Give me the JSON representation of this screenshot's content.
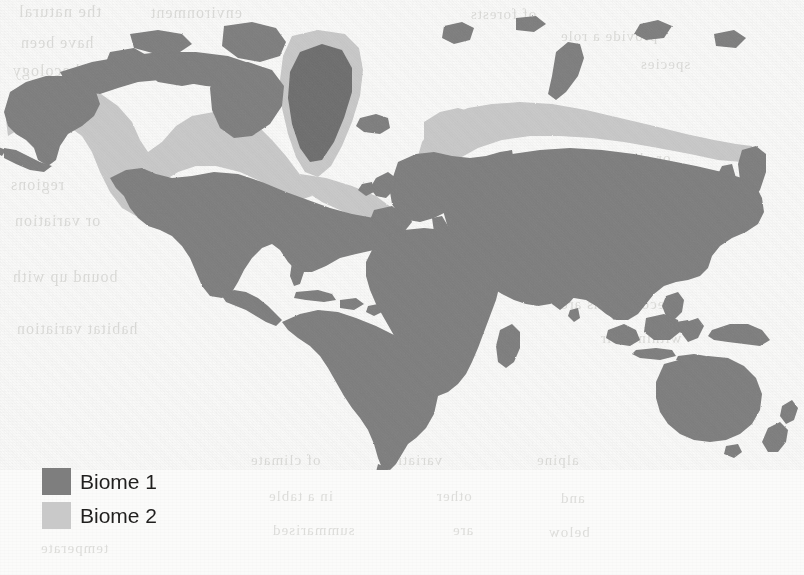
{
  "figure": {
    "type": "thematic-world-map",
    "projection": "equirectangular-world",
    "background_color": "#fbfbfa",
    "medium": "scanned book page with faint reverse-side bleed-through text"
  },
  "legend": {
    "items": [
      {
        "label": "Biome 1",
        "color": "#7e7e7e",
        "swatch_name": "biome-1-swatch"
      },
      {
        "label": "Biome 2",
        "color": "#c9c9c9",
        "swatch_name": "biome-2-swatch"
      }
    ]
  },
  "map": {
    "colors": {
      "biome_1": "#7e7e7e",
      "biome_2": "#c9c9c9",
      "ice_sheet": "#6e6e6e",
      "ocean": "#fbfbfa"
    },
    "regions_biome_1": [
      "North America (south of taiga belt)",
      "Alaska and Aleutian Islands",
      "Canadian Arctic Archipelago",
      "Central America and Caribbean",
      "South America (entire continent)",
      "Africa (entire continent)",
      "Europe (south of Scandinavia)",
      "Middle East and Arabia",
      "Central and South Asia",
      "East Asia and Japan",
      "Southeast Asia and Indonesia",
      "Australia",
      "New Guinea",
      "New Zealand"
    ],
    "regions_biome_2": [
      "Central Canada taiga belt",
      "Greenland coastal fringe",
      "Northern Scandinavia",
      "Northern Russia / Siberian Arctic coast",
      "Kamchatka northern margin"
    ],
    "regions_ice_sheet": [
      "Greenland interior ice sheet"
    ]
  },
  "bleed_through_lines": [
    {
      "text": "the natural",
      "x": 18,
      "y": 2,
      "size": 17
    },
    {
      "text": "environment",
      "x": 150,
      "y": 4,
      "size": 16
    },
    {
      "text": "of forests",
      "x": 470,
      "y": 6,
      "size": 15
    },
    {
      "text": "provide a role",
      "x": 560,
      "y": 28,
      "size": 15
    },
    {
      "text": "have been",
      "x": 20,
      "y": 34,
      "size": 16
    },
    {
      "text": "species",
      "x": 640,
      "y": 56,
      "size": 15
    },
    {
      "text": "and ecology",
      "x": 12,
      "y": 62,
      "size": 16
    },
    {
      "text": "or climate",
      "x": 600,
      "y": 150,
      "size": 15
    },
    {
      "text": "regions",
      "x": 10,
      "y": 176,
      "size": 16
    },
    {
      "text": "land use",
      "x": 596,
      "y": 196,
      "size": 15
    },
    {
      "text": "or variation",
      "x": 14,
      "y": 212,
      "size": 16
    },
    {
      "text": "the particular",
      "x": 592,
      "y": 240,
      "size": 15
    },
    {
      "text": "bound up with",
      "x": 12,
      "y": 268,
      "size": 16
    },
    {
      "text": "ecosystems are",
      "x": 560,
      "y": 296,
      "size": 15
    },
    {
      "text": "habitat variation",
      "x": 16,
      "y": 320,
      "size": 16
    },
    {
      "text": "within their",
      "x": 600,
      "y": 330,
      "size": 15
    },
    {
      "text": "of climate",
      "x": 250,
      "y": 452,
      "size": 15
    },
    {
      "text": "variation",
      "x": 380,
      "y": 452,
      "size": 15
    },
    {
      "text": "alpine",
      "x": 536,
      "y": 452,
      "size": 15
    },
    {
      "text": "in a table",
      "x": 268,
      "y": 488,
      "size": 15
    },
    {
      "text": "other",
      "x": 436,
      "y": 488,
      "size": 15
    },
    {
      "text": "and",
      "x": 560,
      "y": 490,
      "size": 15
    },
    {
      "text": "summarised",
      "x": 272,
      "y": 522,
      "size": 15
    },
    {
      "text": "are",
      "x": 452,
      "y": 522,
      "size": 15
    },
    {
      "text": "below",
      "x": 548,
      "y": 524,
      "size": 15
    },
    {
      "text": "temperate",
      "x": 40,
      "y": 540,
      "size": 15
    }
  ]
}
